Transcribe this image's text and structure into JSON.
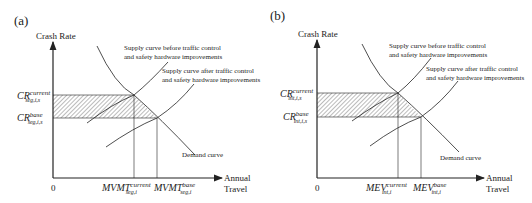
{
  "panels": [
    {
      "id": "a",
      "panel_label": "(a)",
      "y_axis_label": "Crash Rate",
      "x_axis_label_line1": "Annual",
      "x_axis_label_line2": "Travel",
      "origin_label": "0",
      "supply_before_line1": "Supply curve before traffic control",
      "supply_before_line2": "and safety hardware improvements",
      "supply_after_line1": "Supply curve after traffic control",
      "supply_after_line2": "and safety hardware improvements",
      "demand_label": "Demand curve",
      "cr_current": {
        "base": "CR",
        "sup": "current",
        "sub": "seg,i,s"
      },
      "cr_base": {
        "base": "CR",
        "sup": "base",
        "sub": "seg,i,s"
      },
      "x_current": {
        "base": "MVMT",
        "sup": "current",
        "sub": "seg,i"
      },
      "x_base": {
        "base": "MVMT",
        "sup": "base",
        "sub": "seg,i"
      }
    },
    {
      "id": "b",
      "panel_label": "(b)",
      "y_axis_label": "Crash Rate",
      "x_axis_label_line1": "Annual",
      "x_axis_label_line2": "Travel",
      "origin_label": "0",
      "supply_before_line1": "Supply curve before traffic control",
      "supply_before_line2": "and safety hardware improvements",
      "supply_after_line1": "Supply curve after traffic control",
      "supply_after_line2": "and safety hardware improvements",
      "demand_label": "Demand curve",
      "cr_current": {
        "base": "CR",
        "sup": "current",
        "sub": "int,i,s"
      },
      "cr_base": {
        "base": "CR",
        "sup": "base",
        "sub": "int,i,s"
      },
      "x_current": {
        "base": "MEV",
        "sup": "current",
        "sub": "int,i"
      },
      "x_base": {
        "base": "MEV",
        "sup": "base",
        "sub": "int,i"
      }
    }
  ],
  "colors": {
    "line": "#222222",
    "hatch": "#555555"
  }
}
